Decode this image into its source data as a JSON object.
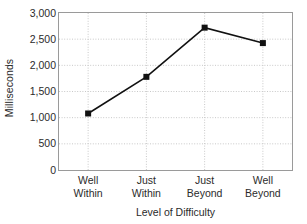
{
  "chart_data": {
    "type": "line",
    "title": "",
    "subtitle": "",
    "xlabel": "Level of Difficulty",
    "ylabel": "Milliseconds",
    "categories": [
      "Well Within",
      "Just Within",
      "Just Beyond",
      "Well Beyond"
    ],
    "category_lines": [
      [
        "Well",
        "Within"
      ],
      [
        "Just",
        "Within"
      ],
      [
        "Just",
        "Beyond"
      ],
      [
        "Well",
        "Beyond"
      ]
    ],
    "values": [
      1080,
      1780,
      2720,
      2425
    ],
    "series": [
      {
        "name": "Response Time",
        "values": [
          1080,
          1780,
          2720,
          2425
        ]
      }
    ],
    "ylim": [
      0,
      3000
    ],
    "ytick_values": [
      0,
      500,
      1000,
      1500,
      2000,
      2500,
      3000
    ],
    "ytick_labels": [
      "0",
      "500",
      "1,000",
      "1,500",
      "2,000",
      "2,500",
      "3,000"
    ],
    "grid": {
      "horizontal": true,
      "vertical": true,
      "style": "dotted"
    },
    "legend": {
      "visible": false,
      "position": "none",
      "entries": []
    },
    "marker": {
      "shape": "square",
      "size": 6,
      "color": "#111111"
    },
    "line": {
      "color": "#111111",
      "width": 1.6
    },
    "colors": {
      "series": "#111111",
      "grid": "#c8c8c8",
      "axis": "#9a9a9a",
      "text": "#2b2b2b",
      "background": "#ffffff"
    }
  }
}
